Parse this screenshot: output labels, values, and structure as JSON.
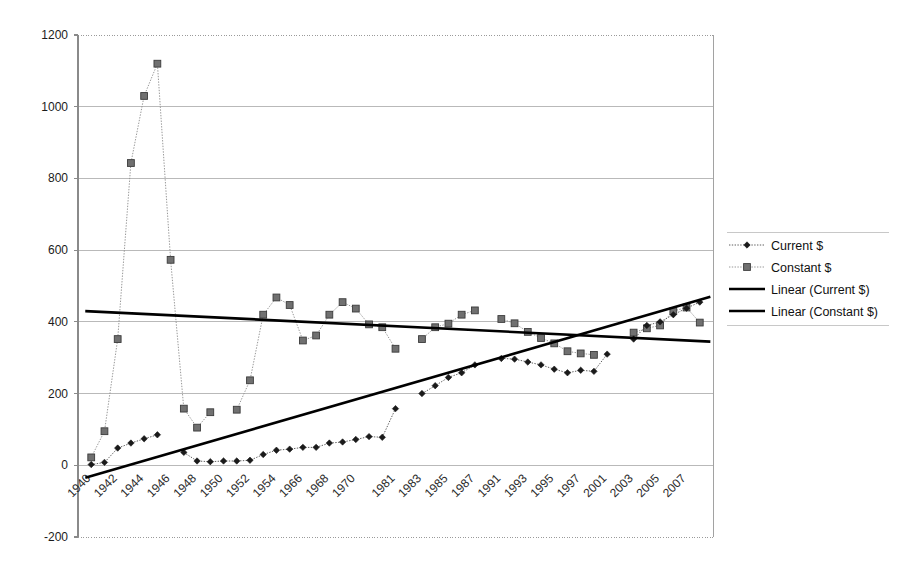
{
  "chart_data": {
    "type": "line",
    "title": "",
    "subtitle": "",
    "xlabel": "",
    "ylabel": "",
    "ylim": [
      -200,
      1200
    ],
    "ytick_step": 200,
    "yticks": [
      1200,
      1000,
      800,
      600,
      400,
      200,
      0,
      -200
    ],
    "grid": true,
    "legend_position": "right",
    "categories": [
      "1940",
      "1941",
      "1942",
      "1943",
      "1944",
      "1945",
      "1946",
      "1947",
      "1948",
      "1949",
      "1950",
      "1951",
      "1952",
      "1953",
      "1954",
      "1955",
      "1966",
      "1967",
      "1968",
      "1969",
      "1970",
      "1971",
      "1972",
      "1981",
      "1982",
      "1983",
      "1984",
      "1985",
      "1986",
      "1987",
      "1988",
      "1991",
      "1992",
      "1993",
      "1994",
      "1995",
      "1996",
      "1997",
      "1998",
      "2001",
      "2002",
      "2003",
      "2004",
      "2005",
      "2006",
      "2007",
      "2008"
    ],
    "xtick_labels": [
      "1940",
      "1942",
      "1944",
      "1946",
      "1948",
      "1950",
      "1952",
      "1954",
      "1966",
      "1968",
      "1970",
      "1981",
      "1983",
      "1985",
      "1987",
      "1991",
      "1993",
      "1995",
      "1997",
      "2001",
      "2003",
      "2005",
      "2007"
    ],
    "series": [
      {
        "name": "Current $",
        "marker": "diamond",
        "style": "dotted",
        "values": [
          2,
          8,
          48,
          62,
          74,
          85,
          null,
          36,
          12,
          10,
          12,
          12,
          14,
          30,
          42,
          45,
          50,
          50,
          62,
          65,
          72,
          80,
          78,
          158,
          null,
          200,
          222,
          245,
          258,
          280,
          null,
          298,
          296,
          288,
          280,
          268,
          258,
          265,
          262,
          310,
          null,
          352,
          390,
          400,
          420,
          438,
          455
        ]
      },
      {
        "name": "Constant $",
        "marker": "square",
        "style": "dotted",
        "values": [
          22,
          95,
          352,
          843,
          1030,
          1120,
          573,
          158,
          105,
          148,
          null,
          155,
          237,
          420,
          468,
          447,
          348,
          362,
          420,
          455,
          437,
          393,
          385,
          325,
          null,
          352,
          385,
          395,
          420,
          432,
          null,
          408,
          396,
          372,
          355,
          340,
          318,
          312,
          308,
          null,
          null,
          370,
          382,
          390,
          430,
          440,
          398
        ]
      }
    ],
    "trendlines": [
      {
        "name": "Linear (Current $)",
        "y_start": -35,
        "y_end": 470
      },
      {
        "name": "Linear (Constant $)",
        "y_start": 430,
        "y_end": 345
      }
    ],
    "legend": [
      {
        "label": "Current $",
        "type": "series-diamond"
      },
      {
        "label": "Constant $",
        "type": "series-square"
      },
      {
        "label": "Linear (Current $)",
        "type": "trend"
      },
      {
        "label": "Linear (Constant $)",
        "type": "trend"
      }
    ]
  },
  "colors": {
    "current_marker": "#1a1a1a",
    "constant_marker": "#707070",
    "trend": "#000000",
    "grid": "#b9b9b9",
    "background": "#ffffff"
  }
}
